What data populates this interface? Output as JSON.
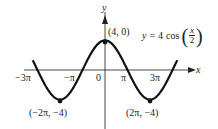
{
  "equation": {
    "lhs": "y",
    "equals": "=",
    "coef": "4",
    "func": "cos",
    "numerator": "x",
    "denominator": "2",
    "open_paren": "(",
    "close_paren": ")"
  },
  "axes": {
    "x_label": "x",
    "y_label": "y",
    "origin_label": "0"
  },
  "ticks": {
    "neg3pi": "−3π",
    "negpi": "−π",
    "pi": "π",
    "threepi": "3π"
  },
  "points": {
    "max": "(4, 0)",
    "min_left": "(−2π, −4)",
    "min_right": "(2π, −4)"
  },
  "colors": {
    "curve": "#111111",
    "axis": "#333333",
    "background": "#ffffff"
  },
  "chart_data": {
    "type": "line",
    "xlabel": "x",
    "ylabel": "y",
    "x_ticks": [
      "−3π",
      "−π",
      "0",
      "π",
      "3π"
    ],
    "x_tick_values": [
      -9.4248,
      -3.1416,
      0,
      3.1416,
      9.4248
    ],
    "xlim": [
      -10.5,
      10.5
    ],
    "ylim": [
      -4.5,
      6
    ],
    "series": [
      {
        "name": "y = 4 cos(x/2)",
        "x": [
          -10.0,
          -9.4248,
          -8.0,
          -6.2832,
          -4.0,
          -3.1416,
          -2.0,
          0,
          2.0,
          3.1416,
          4.0,
          6.2832,
          8.0,
          9.4248,
          10.0
        ],
        "values": [
          1.13,
          0,
          -2.61,
          -4,
          -1.66,
          0,
          2.16,
          4,
          2.16,
          0,
          -1.66,
          -4,
          -2.61,
          0,
          1.13
        ]
      }
    ],
    "annotations": [
      {
        "label": "(4, 0)",
        "x": 0,
        "y": 4
      },
      {
        "label": "(−2π, −4)",
        "x": -6.2832,
        "y": -4
      },
      {
        "label": "(2π, −4)",
        "x": 6.2832,
        "y": -4
      }
    ],
    "grid": false,
    "legend": "none"
  }
}
